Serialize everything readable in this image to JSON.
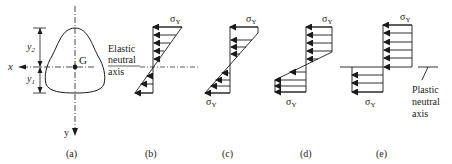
{
  "figure": {
    "panels": [
      {
        "id": "a",
        "caption": "(a)"
      },
      {
        "id": "b",
        "caption": "(b)"
      },
      {
        "id": "c",
        "caption": "(c)"
      },
      {
        "id": "d",
        "caption": "(d)"
      },
      {
        "id": "e",
        "caption": "(e)"
      }
    ],
    "section": {
      "x_axis_label": "x",
      "y_axis_label": "y",
      "centroid_label": "G",
      "dim_upper_label": "y",
      "dim_upper_sub": "2",
      "dim_lower_label": "y",
      "dim_lower_sub": "1"
    },
    "elastic_neutral_axis": {
      "line1": "Elastic",
      "line2": "neutral",
      "line3": "axis"
    },
    "plastic_neutral_axis": {
      "line1": "Plastic",
      "line2": "neutral",
      "line3": "axis"
    },
    "stress_label": "σ",
    "stress_sub": "Y",
    "colors": {
      "ink": "#1a1a1a",
      "background": "#ffffff"
    }
  }
}
